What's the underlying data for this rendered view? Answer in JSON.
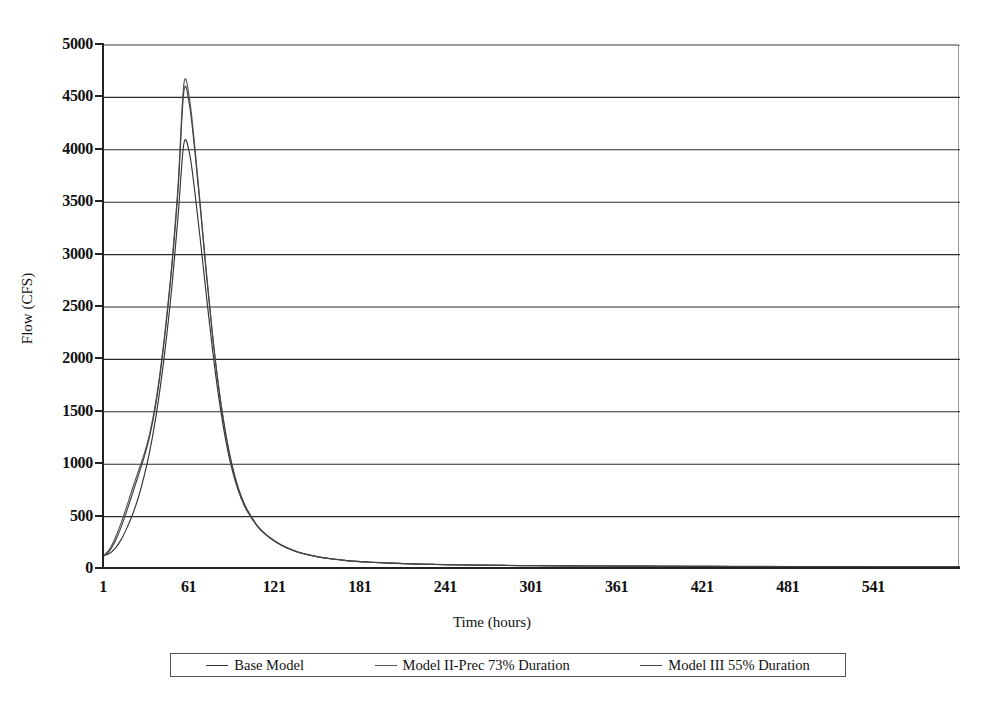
{
  "chart_data": {
    "type": "line",
    "title": "",
    "xlabel": "Time (hours)",
    "ylabel": "Flow (CFS)",
    "xlim": [
      1,
      601
    ],
    "ylim": [
      0,
      5000
    ],
    "grid": true,
    "legend_position": "bottom",
    "x_ticks": [
      "1",
      "61",
      "121",
      "181",
      "241",
      "301",
      "361",
      "421",
      "481",
      "541"
    ],
    "x_tick_values": [
      1,
      61,
      121,
      181,
      241,
      301,
      361,
      421,
      481,
      541
    ],
    "y_ticks": [
      "0",
      "500",
      "1000",
      "1500",
      "2000",
      "2500",
      "3000",
      "3500",
      "4000",
      "4500",
      "5000"
    ],
    "y_tick_values": [
      0,
      500,
      1000,
      1500,
      2000,
      2500,
      3000,
      3500,
      4000,
      4500,
      5000
    ],
    "line_color": "#333333",
    "series": [
      {
        "name": "Base Model",
        "color": "#333333",
        "peak_value": 4070,
        "peak_time": 57,
        "x": [
          1,
          5,
          9,
          13,
          17,
          21,
          25,
          29,
          33,
          37,
          41,
          45,
          49,
          53,
          57,
          61,
          65,
          69,
          73,
          77,
          81,
          85,
          89,
          93,
          97,
          101,
          109,
          117,
          125,
          133,
          141,
          151,
          161,
          171,
          181,
          191,
          201,
          211,
          221,
          231,
          241,
          261,
          281,
          301,
          321,
          341,
          361,
          381,
          401,
          421,
          441,
          481,
          521,
          561,
          601
        ],
        "y": [
          130,
          150,
          200,
          280,
          390,
          520,
          680,
          880,
          1120,
          1420,
          1790,
          2230,
          2750,
          3380,
          4060,
          3960,
          3560,
          3080,
          2580,
          2100,
          1680,
          1330,
          1050,
          840,
          680,
          560,
          400,
          300,
          230,
          180,
          145,
          115,
          95,
          80,
          70,
          62,
          56,
          51,
          47,
          44,
          41,
          37,
          34,
          32,
          30,
          29,
          28,
          27,
          26,
          25,
          24,
          23,
          22,
          21,
          20
        ]
      },
      {
        "name": "Model II-Prec 73% Duration",
        "color": "#555555",
        "peak_value": 4640,
        "peak_time": 57,
        "x": [
          1,
          5,
          9,
          13,
          17,
          21,
          25,
          29,
          33,
          37,
          41,
          45,
          49,
          53,
          57,
          61,
          65,
          69,
          73,
          77,
          81,
          85,
          89,
          93,
          97,
          101,
          109,
          117,
          125,
          133,
          141,
          151,
          161,
          171,
          181,
          191,
          201,
          211,
          221,
          231,
          241,
          261,
          281,
          301,
          321,
          341,
          361,
          381,
          401,
          421,
          441,
          481,
          521,
          561,
          601
        ],
        "y": [
          125,
          190,
          300,
          440,
          600,
          770,
          930,
          1090,
          1290,
          1570,
          1950,
          2420,
          2980,
          3680,
          4630,
          4480,
          3980,
          3400,
          2800,
          2250,
          1780,
          1400,
          1100,
          870,
          700,
          575,
          405,
          303,
          232,
          182,
          147,
          117,
          96,
          81,
          71,
          63,
          57,
          52,
          48,
          45,
          42,
          38,
          35,
          33,
          31,
          30,
          29,
          28,
          27,
          26,
          25,
          24,
          23,
          22,
          21
        ]
      },
      {
        "name": "Model III 55% Duration",
        "color": "#444444",
        "peak_value": 4560,
        "peak_time": 57,
        "x": [
          1,
          5,
          9,
          13,
          17,
          21,
          25,
          29,
          33,
          37,
          41,
          45,
          49,
          53,
          57,
          61,
          65,
          69,
          73,
          77,
          81,
          85,
          89,
          93,
          97,
          101,
          109,
          117,
          125,
          133,
          141,
          151,
          161,
          171,
          181,
          191,
          201,
          211,
          221,
          231,
          241,
          261,
          281,
          301,
          321,
          341,
          361,
          381,
          401,
          421,
          441,
          481,
          521,
          561,
          601
        ],
        "y": [
          128,
          175,
          270,
          400,
          555,
          720,
          890,
          1060,
          1265,
          1545,
          1925,
          2395,
          2950,
          3640,
          4560,
          4420,
          3940,
          3370,
          2780,
          2235,
          1770,
          1392,
          1094,
          866,
          696,
          572,
          403,
          301,
          231,
          181,
          146,
          116,
          95,
          80,
          70,
          62,
          56,
          51,
          47,
          44,
          41,
          37,
          34,
          32,
          30,
          29,
          28,
          27,
          26,
          25,
          24,
          23,
          22,
          21,
          20
        ]
      }
    ]
  },
  "axes": {
    "y_title": "Flow (CFS)",
    "x_title": "Time (hours)"
  },
  "legend": {
    "items": [
      {
        "label": "Base Model"
      },
      {
        "label": "Model II-Prec 73% Duration"
      },
      {
        "label": "Model III 55% Duration"
      }
    ]
  }
}
